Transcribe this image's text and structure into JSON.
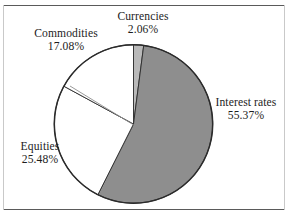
{
  "figure": {
    "background_color": "#ffffff",
    "frame_color": "#5a5a5a",
    "width": 288,
    "height": 217
  },
  "chart_data": {
    "type": "pie",
    "title": "",
    "subtitle": "",
    "xlabel": "",
    "ylabel": "",
    "legend_position": "none",
    "labels_position": "outside",
    "grid": false,
    "start_angle_deg": 0,
    "direction": "clockwise",
    "units": "percent",
    "categories": [
      "Currencies",
      "Interest rates",
      "Equities",
      "Commodities"
    ],
    "values": [
      2.06,
      55.37,
      25.48,
      17.08
    ],
    "colors": [
      "#b9b9b9",
      "#8e8e8e",
      "#ffffff",
      "#ffffff"
    ],
    "slices": [
      {
        "name": "Currencies",
        "value": 2.06,
        "display_value": "2.06%",
        "color": "#b9b9b9",
        "start_deg": 0.0,
        "end_deg": 7.42
      },
      {
        "name": "Interest rates",
        "value": 55.37,
        "display_value": "55.37%",
        "color": "#8e8e8e",
        "start_deg": 7.42,
        "end_deg": 206.75
      },
      {
        "name": "Equities",
        "value": 25.48,
        "display_value": "25.48%",
        "color": "#ffffff",
        "start_deg": 206.75,
        "end_deg": 298.48
      },
      {
        "name": "Commodities",
        "value": 17.08,
        "display_value": "17.08%",
        "color": "#ffffff",
        "start_deg": 298.48,
        "end_deg": 360.0
      }
    ]
  },
  "labels": {
    "currencies": {
      "name": "Currencies",
      "percent": "2.06%"
    },
    "commodities": {
      "name": "Commodities",
      "percent": "17.08%"
    },
    "equities": {
      "name": "Equities",
      "percent": "25.48%"
    },
    "interest_rates": {
      "name": "Interest rates",
      "percent": "55.37%"
    }
  }
}
